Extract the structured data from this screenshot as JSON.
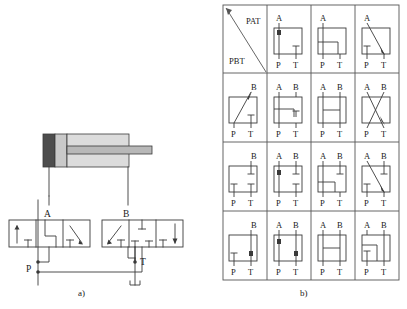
{
  "figure": {
    "caption_a": "a)",
    "caption_b": "b)",
    "type": "hydraulic-schematic"
  },
  "circuit": {
    "labels": {
      "port_a": "A",
      "port_b": "B",
      "supply_p": "P",
      "tank_t": "T"
    },
    "colors": {
      "line": "#3a3a3a",
      "cylinder_cap": "#4d4d4d",
      "cylinder_piston": "#c9c9c9",
      "cylinder_body": "#d9d9d9",
      "rod": "#b3b3b3"
    },
    "components": [
      {
        "name": "cylinder",
        "kind": "double-acting-cylinder"
      },
      {
        "name": "valve-a",
        "kind": "4-3-directional-valve",
        "label": "A"
      },
      {
        "name": "valve-b",
        "kind": "4-3-directional-valve",
        "label": "B"
      }
    ]
  },
  "matrix": {
    "header": {
      "col_key": "PAT",
      "row_key": "PBT"
    },
    "port_labels": {
      "a": "A",
      "b": "B",
      "p": "P",
      "t": "T"
    },
    "cells": [
      [
        {
          "name": "header-diagonal",
          "top_label": "PAT",
          "bottom_label": "PBT",
          "symbol": "diagonal-split"
        },
        {
          "name": "cell-r0c1",
          "top": [
            "A"
          ],
          "bottom": [
            "P",
            "T"
          ],
          "symbol": "a-p-through-arrow-t-blocked"
        },
        {
          "name": "cell-r0c2",
          "top": [
            "A"
          ],
          "bottom": [
            "P",
            "T"
          ],
          "symbol": "a-p-through-t-bracket"
        },
        {
          "name": "cell-r0c3",
          "top": [
            "A"
          ],
          "bottom": [
            "P",
            "T"
          ],
          "symbol": "a-to-t-diagonal-p-blocked"
        }
      ],
      [
        {
          "name": "cell-r1c0",
          "top": [
            "B"
          ],
          "bottom": [
            "P",
            "T"
          ],
          "symbol": "p-to-b-diagonal-t-blocked"
        },
        {
          "name": "cell-r1c1",
          "top": [
            "A",
            "B"
          ],
          "bottom": [
            "P",
            "T"
          ],
          "symbol": "a-p-through-b-t-bracket"
        },
        {
          "name": "cell-r1c2",
          "top": [
            "A",
            "B"
          ],
          "bottom": [
            "P",
            "T"
          ],
          "symbol": "h-bridge"
        },
        {
          "name": "cell-r1c3",
          "top": [
            "A",
            "B"
          ],
          "bottom": [
            "P",
            "T"
          ],
          "symbol": "x-cross"
        }
      ],
      [
        {
          "name": "cell-r2c0",
          "top": [
            "B"
          ],
          "bottom": [
            "P",
            "T"
          ],
          "symbol": "all-blocked-b-stub"
        },
        {
          "name": "cell-r2c1",
          "top": [
            "A",
            "B"
          ],
          "bottom": [
            "P",
            "T"
          ],
          "symbol": "a-p-through-b-t-blocked"
        },
        {
          "name": "cell-r2c2",
          "top": [
            "A",
            "B"
          ],
          "bottom": [
            "P",
            "T"
          ],
          "symbol": "p-bracket-b-stub"
        },
        {
          "name": "cell-r2c3",
          "top": [
            "A",
            "B"
          ],
          "bottom": [
            "P",
            "T"
          ],
          "symbol": "a-to-t-diagonal-b-stub"
        }
      ],
      [
        {
          "name": "cell-r3c0",
          "top": [
            "B"
          ],
          "bottom": [
            "P",
            "T"
          ],
          "symbol": "b-t-through-p-blocked"
        },
        {
          "name": "cell-r3c1",
          "top": [
            "A",
            "B"
          ],
          "bottom": [
            "P",
            "T"
          ],
          "symbol": "a-p-and-b-t-through"
        },
        {
          "name": "cell-r3c2",
          "top": [
            "A",
            "B"
          ],
          "bottom": [
            "P",
            "T"
          ],
          "symbol": "h-bridge-open"
        },
        {
          "name": "cell-r3c3",
          "top": [
            "A",
            "B"
          ],
          "bottom": [
            "P",
            "T"
          ],
          "symbol": "b-t-through-p-bracket"
        }
      ]
    ]
  }
}
